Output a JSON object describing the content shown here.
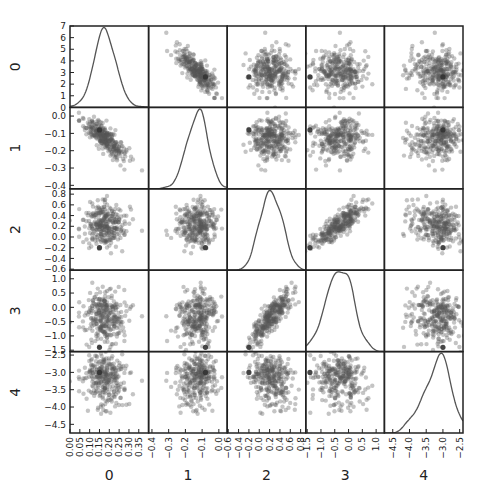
{
  "chart_data": {
    "type": "scatter_matrix",
    "title": "",
    "variables": [
      "0",
      "1",
      "2",
      "3",
      "4"
    ],
    "diagonal": "kde",
    "grid": false,
    "legend": null,
    "point_color": "#555555",
    "point_alpha": 0.35,
    "line_color": "#555555",
    "frame_color": "#222222",
    "layout": {
      "left": 70,
      "top": 26,
      "right": 463,
      "bottom": 433,
      "col_edges": [
        70,
        148.6,
        227.2,
        305.8,
        384.4,
        463
      ],
      "row_edges": [
        26,
        107.4,
        188.8,
        270.2,
        351.6,
        433
      ]
    },
    "axes": [
      {
        "name": "0",
        "lim": [
          0.0,
          0.4
        ],
        "ticks": [
          0.0,
          0.05,
          0.1,
          0.15,
          0.2,
          0.25,
          0.3,
          0.35
        ],
        "tick_labels": [
          "0.00",
          "0.05",
          "0.10",
          "0.15",
          "0.20",
          "0.25",
          "0.30",
          "0.35"
        ],
        "mean": 0.17,
        "sd": 0.06
      },
      {
        "name": "1",
        "lim": [
          -0.42,
          0.05
        ],
        "ticks": [
          -0.4,
          -0.3,
          -0.2,
          -0.1,
          0.0
        ],
        "tick_labels": [
          "−0.4",
          "−0.3",
          "−0.2",
          "−0.1",
          "0.0"
        ],
        "mean": -0.12,
        "sd": 0.065
      },
      {
        "name": "2",
        "lim": [
          -0.62,
          0.9
        ],
        "ticks": [
          -0.6,
          -0.4,
          -0.2,
          0.0,
          0.2,
          0.4,
          0.6,
          0.8
        ],
        "tick_labels": [
          "−0.6",
          "−0.4",
          "−0.2",
          "0.0",
          "0.2",
          "0.4",
          "0.6",
          "0.8"
        ],
        "mean": 0.22,
        "sd": 0.2
      },
      {
        "name": "3",
        "lim": [
          -1.55,
          1.3
        ],
        "ticks": [
          -1.5,
          -1.0,
          -0.5,
          0.0,
          0.5,
          1.0
        ],
        "tick_labels": [
          "−1.5",
          "−1.0",
          "−0.5",
          "0.0",
          "0.5",
          "1.0"
        ],
        "mean": -0.35,
        "sd": 0.45
      },
      {
        "name": "4",
        "lim": [
          -4.75,
          -2.4
        ],
        "ticks": [
          -4.5,
          -4.0,
          -3.5,
          -3.0,
          -2.5
        ],
        "tick_labels": [
          "−4.5",
          "−4.0",
          "−3.5",
          "−3.0",
          "−2.5"
        ],
        "mean": -3.15,
        "sd": 0.4
      }
    ],
    "diag_ylim_first": [
      0,
      7
    ],
    "diag_yticks_first": [
      0,
      1,
      2,
      3,
      4,
      5,
      6,
      7
    ],
    "correlations": [
      [
        1.0,
        -0.85,
        0.0,
        0.0,
        0.05
      ],
      [
        -0.85,
        1.0,
        0.0,
        0.05,
        0.0
      ],
      [
        0.0,
        0.0,
        1.0,
        0.82,
        -0.25
      ],
      [
        0.0,
        0.05,
        0.82,
        1.0,
        -0.15
      ],
      [
        0.05,
        0.0,
        -0.25,
        -0.15,
        1.0
      ]
    ],
    "n_points": 300,
    "outlier": [
      0.15,
      -0.08,
      -0.2,
      -1.4,
      -3.0
    ]
  }
}
